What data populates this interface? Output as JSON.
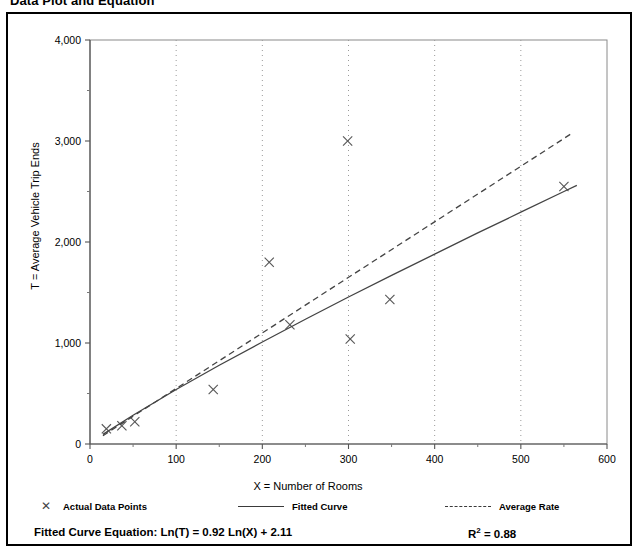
{
  "page": {
    "title": "Data Plot and Equation"
  },
  "chart_data": {
    "type": "scatter",
    "title": "Data Plot and Equation",
    "xlabel": "X = Number of Rooms",
    "ylabel": "T = Average Vehicle Trip Ends",
    "xlim": [
      0,
      600
    ],
    "ylim": [
      0,
      4000
    ],
    "xticks": [
      0,
      100,
      200,
      300,
      400,
      500,
      600
    ],
    "xtick_labels": [
      "0",
      "100",
      "200",
      "300",
      "400",
      "500",
      "600"
    ],
    "yticks": [
      0,
      1000,
      2000,
      3000,
      4000
    ],
    "ytick_labels": [
      "0",
      "1,000",
      "2,000",
      "3,000",
      "4,000"
    ],
    "y_minor_ticks": [
      500,
      1500,
      2500,
      3500
    ],
    "x_minor_ticks": [
      50,
      150,
      250,
      350,
      450,
      550
    ],
    "grid": "dotted-vertical-at-major-x",
    "legend_position": "below-plot",
    "series": [
      {
        "name": "Actual Data Points",
        "type": "scatter",
        "marker": "x",
        "color": "#555555",
        "points": [
          {
            "x": 19,
            "y": 150
          },
          {
            "x": 37,
            "y": 180
          },
          {
            "x": 52,
            "y": 220
          },
          {
            "x": 143,
            "y": 540
          },
          {
            "x": 208,
            "y": 1800
          },
          {
            "x": 232,
            "y": 1180
          },
          {
            "x": 299,
            "y": 3000
          },
          {
            "x": 302,
            "y": 1040
          },
          {
            "x": 348,
            "y": 1430
          },
          {
            "x": 550,
            "y": 2550
          }
        ]
      },
      {
        "name": "Fitted Curve",
        "type": "line",
        "style": "solid",
        "color": "#444444",
        "equation": "Ln(T) = 0.92 Ln(X) + 2.11",
        "points": [
          {
            "x": 15,
            "y": 95
          },
          {
            "x": 50,
            "y": 285
          },
          {
            "x": 100,
            "y": 540
          },
          {
            "x": 150,
            "y": 780
          },
          {
            "x": 200,
            "y": 1010
          },
          {
            "x": 250,
            "y": 1235
          },
          {
            "x": 300,
            "y": 1455
          },
          {
            "x": 350,
            "y": 1670
          },
          {
            "x": 400,
            "y": 1880
          },
          {
            "x": 450,
            "y": 2090
          },
          {
            "x": 500,
            "y": 2295
          },
          {
            "x": 550,
            "y": 2500
          },
          {
            "x": 565,
            "y": 2560
          }
        ]
      },
      {
        "name": "Average Rate",
        "type": "line",
        "style": "dashed",
        "color": "#444444",
        "points": [
          {
            "x": 15,
            "y": 82
          },
          {
            "x": 560,
            "y": 3080
          }
        ]
      }
    ],
    "annotations": {
      "equation_label": "Fitted Curve Equation:",
      "equation": "Ln(T) = 0.92 Ln(X) + 2.11",
      "r_squared_label": "R",
      "r_squared_exponent": "2",
      "r_squared_value": "= 0.88"
    }
  },
  "legend": {
    "items": [
      {
        "label": "Actual Data Points",
        "marker": "x"
      },
      {
        "label": "Fitted Curve",
        "marker": "solid-line"
      },
      {
        "label": "Average Rate",
        "marker": "dashed-line"
      }
    ]
  },
  "equation_row": {
    "fitted_equation": "Fitted Curve Equation:  Ln(T) = 0.92 Ln(X) + 2.11",
    "r_squared_prefix": "R",
    "r_squared_sup": "2",
    "r_squared_suffix": " = 0.88"
  }
}
